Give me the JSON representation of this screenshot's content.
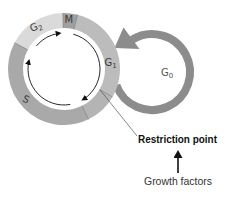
{
  "diagram": {
    "colors": {
      "g1": "#bcbcbc",
      "late_g1": "#b4b4b4",
      "s": "#a9a9a9",
      "g2": "#dadada",
      "m": "#a0a0a0",
      "g0_arc": "#8c8c8c",
      "boundary": "#7a7a7a",
      "arrows": "#111111"
    },
    "phases": [
      {
        "id": "g2",
        "main": "G",
        "sub": "2"
      },
      {
        "id": "m",
        "main": "M",
        "sub": ""
      },
      {
        "id": "g1",
        "main": "G",
        "sub": "1"
      },
      {
        "id": "s",
        "main": "S",
        "sub": ""
      },
      {
        "id": "g0",
        "main": "G",
        "sub": "0"
      }
    ],
    "annotations": {
      "restriction_point": "Restriction point",
      "growth_factors": "Growth factors"
    }
  }
}
